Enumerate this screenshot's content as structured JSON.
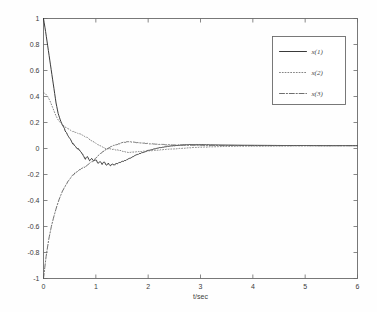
{
  "chart_data": {
    "type": "line",
    "title": "",
    "subtitle": "",
    "xlabel": "t/sec",
    "ylabel": "",
    "xlim": [
      0,
      6
    ],
    "ylim": [
      -1,
      1
    ],
    "xticks": [
      "0",
      "1",
      "2",
      "3",
      "4",
      "5",
      "6"
    ],
    "xtick_values": [
      0,
      1,
      2,
      3,
      4,
      5,
      6
    ],
    "yticks": [
      "1",
      "0.8",
      "0.6",
      "0.4",
      "0.2",
      "0",
      "-0.2",
      "-0.4",
      "-0.6",
      "-0.8",
      "-1"
    ],
    "ytick_values": [
      1,
      0.8,
      0.6,
      0.4,
      0.2,
      0,
      -0.2,
      -0.4,
      -0.6,
      -0.8,
      -1
    ],
    "grid": false,
    "legend_position": "top-right",
    "box": true,
    "tick_direction": "in",
    "series": [
      {
        "name": "x(1)",
        "style": "solid",
        "color": "#2f2f2f",
        "x": [
          0,
          0.04,
          0.08,
          0.12,
          0.16,
          0.2,
          0.24,
          0.28,
          0.32,
          0.36,
          0.4,
          0.44,
          0.48,
          0.52,
          0.56,
          0.6,
          0.64,
          0.68,
          0.72,
          0.76,
          0.8,
          0.84,
          0.88,
          0.92,
          0.96,
          1.0,
          1.04,
          1.08,
          1.12,
          1.16,
          1.2,
          1.24,
          1.28,
          1.32,
          1.36,
          1.4,
          1.5,
          1.6,
          1.7,
          1.8,
          1.9,
          2.0,
          2.2,
          2.4,
          2.6,
          2.8,
          3.0,
          3.4,
          3.8,
          4.2,
          4.6,
          5.0,
          5.4,
          5.8,
          6.0
        ],
        "y": [
          1.0,
          0.9,
          0.79,
          0.68,
          0.57,
          0.46,
          0.35,
          0.27,
          0.22,
          0.18,
          0.15,
          0.12,
          0.09,
          0.065,
          0.04,
          0.02,
          0.005,
          -0.01,
          -0.03,
          -0.05,
          -0.08,
          -0.065,
          -0.095,
          -0.075,
          -0.1,
          -0.085,
          -0.115,
          -0.1,
          -0.12,
          -0.105,
          -0.125,
          -0.115,
          -0.13,
          -0.12,
          -0.125,
          -0.115,
          -0.1,
          -0.085,
          -0.065,
          -0.045,
          -0.03,
          -0.015,
          0.005,
          0.018,
          0.026,
          0.03,
          0.03,
          0.027,
          0.025,
          0.024,
          0.023,
          0.023,
          0.022,
          0.022,
          0.022
        ]
      },
      {
        "name": "x(2)",
        "style": "dotted",
        "color": "#6e6e6e",
        "x": [
          0,
          0.04,
          0.08,
          0.12,
          0.16,
          0.2,
          0.24,
          0.28,
          0.32,
          0.36,
          0.4,
          0.44,
          0.48,
          0.52,
          0.56,
          0.6,
          0.64,
          0.68,
          0.72,
          0.76,
          0.8,
          0.84,
          0.88,
          0.92,
          0.96,
          1.0,
          1.04,
          1.08,
          1.12,
          1.16,
          1.2,
          1.3,
          1.4,
          1.5,
          1.6,
          1.7,
          1.8,
          1.9,
          2.0,
          2.2,
          2.4,
          2.6,
          2.8,
          3.0,
          3.4,
          3.8,
          4.2,
          4.6,
          5.0,
          5.4,
          5.8,
          6.0
        ],
        "y": [
          0.43,
          0.42,
          0.4,
          0.37,
          0.33,
          0.29,
          0.25,
          0.22,
          0.2,
          0.185,
          0.17,
          0.158,
          0.148,
          0.14,
          0.133,
          0.125,
          0.12,
          0.115,
          0.11,
          0.1,
          0.09,
          0.082,
          0.07,
          0.062,
          0.05,
          0.04,
          0.028,
          0.02,
          0.012,
          0.005,
          0.0,
          -0.005,
          -0.01,
          -0.02,
          -0.03,
          -0.028,
          -0.025,
          -0.022,
          -0.018,
          -0.012,
          -0.005,
          0.0,
          0.006,
          0.01,
          0.015,
          0.018,
          0.019,
          0.02,
          0.021,
          0.021,
          0.022,
          0.022
        ]
      },
      {
        "name": "x(3)",
        "style": "dashdot",
        "color": "#555555",
        "x": [
          0,
          0.05,
          0.1,
          0.15,
          0.2,
          0.25,
          0.3,
          0.35,
          0.4,
          0.45,
          0.5,
          0.55,
          0.6,
          0.65,
          0.7,
          0.75,
          0.8,
          0.85,
          0.9,
          0.95,
          1.0,
          1.05,
          1.1,
          1.15,
          1.2,
          1.3,
          1.4,
          1.5,
          1.6,
          1.7,
          1.8,
          1.9,
          2.0,
          2.2,
          2.4,
          2.6,
          2.8,
          3.0,
          3.4,
          3.8,
          4.2,
          4.6,
          5.0,
          5.4,
          5.8,
          6.0
        ],
        "y": [
          -1.0,
          -0.83,
          -0.7,
          -0.6,
          -0.52,
          -0.45,
          -0.39,
          -0.34,
          -0.3,
          -0.265,
          -0.235,
          -0.21,
          -0.19,
          -0.175,
          -0.16,
          -0.15,
          -0.14,
          -0.125,
          -0.11,
          -0.095,
          -0.075,
          -0.055,
          -0.035,
          -0.02,
          -0.005,
          0.015,
          0.03,
          0.045,
          0.052,
          0.05,
          0.045,
          0.042,
          0.038,
          0.032,
          0.028,
          0.026,
          0.025,
          0.024,
          0.023,
          0.023,
          0.022,
          0.022,
          0.022,
          0.022,
          0.022,
          0.022
        ]
      }
    ]
  },
  "legend": {
    "items": [
      {
        "label": "x(1)",
        "style": "solid"
      },
      {
        "label": "x(2)",
        "style": "dotted"
      },
      {
        "label": "x(3)",
        "style": "dashdot"
      }
    ]
  },
  "colors": {
    "axis": "#6a6a6a",
    "text": "#3c3c3c",
    "background": "#ffffff",
    "series1": "#2f2f2f",
    "series2": "#6e6e6e",
    "series3": "#555555"
  }
}
